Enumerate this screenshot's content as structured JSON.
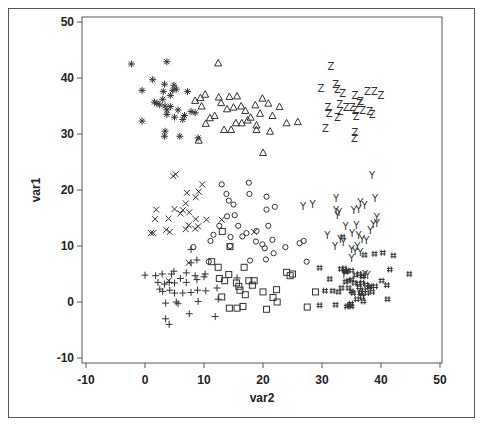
{
  "chart_data": {
    "type": "scatter",
    "title": "",
    "xlabel": "var2",
    "ylabel": "var1",
    "xlim": [
      -10,
      50
    ],
    "ylim": [
      -10,
      50
    ],
    "xticks": [
      -10,
      0,
      10,
      20,
      30,
      40,
      50
    ],
    "yticks": [
      -10,
      0,
      10,
      20,
      30,
      40,
      50
    ],
    "grid": false,
    "legend": null,
    "series": [
      {
        "name": "group_star",
        "marker": "*",
        "points": [
          [
            -2.3,
            42.5
          ],
          [
            3.7,
            42.9
          ],
          [
            -0.5,
            37.8
          ],
          [
            1.3,
            39.7
          ],
          [
            3.3,
            38.9
          ],
          [
            2.0,
            35.5
          ],
          [
            1.6,
            35.7
          ],
          [
            3.0,
            36.2
          ],
          [
            3.1,
            37.6
          ],
          [
            4.7,
            37.8
          ],
          [
            4.9,
            38.7
          ],
          [
            5.3,
            38.0
          ],
          [
            4.3,
            36.9
          ],
          [
            3.4,
            35.0
          ],
          [
            4.3,
            34.9
          ],
          [
            5.6,
            34.3
          ],
          [
            3.7,
            34.3
          ],
          [
            2.5,
            35.2
          ],
          [
            3.7,
            33.5
          ],
          [
            5.0,
            33.0
          ],
          [
            6.7,
            33.3
          ],
          [
            6.4,
            32.6
          ],
          [
            7.8,
            34.0
          ],
          [
            7.2,
            37.6
          ],
          [
            -0.5,
            32.3
          ],
          [
            3.4,
            30.5
          ],
          [
            3.3,
            29.6
          ],
          [
            5.9,
            29.6
          ],
          [
            9.0,
            29.3
          ],
          [
            8.5,
            33.8
          ]
        ]
      },
      {
        "name": "group_triangle",
        "marker": "△",
        "points": [
          [
            12.4,
            42.7
          ],
          [
            8.5,
            36.0
          ],
          [
            9.4,
            36.5
          ],
          [
            10.2,
            37.1
          ],
          [
            9.6,
            35.0
          ],
          [
            11.0,
            32.9
          ],
          [
            10.3,
            31.9
          ],
          [
            11.8,
            33.3
          ],
          [
            12.5,
            36.6
          ],
          [
            12.9,
            35.6
          ],
          [
            13.9,
            34.5
          ],
          [
            14.3,
            36.7
          ],
          [
            15.6,
            36.8
          ],
          [
            15.0,
            34.8
          ],
          [
            16.3,
            35.0
          ],
          [
            17.0,
            34.2
          ],
          [
            15.4,
            32.0
          ],
          [
            16.4,
            32.0
          ],
          [
            17.4,
            32.5
          ],
          [
            17.9,
            33.0
          ],
          [
            18.9,
            31.6
          ],
          [
            19.5,
            33.7
          ],
          [
            18.7,
            35.2
          ],
          [
            19.9,
            36.4
          ],
          [
            20.9,
            35.5
          ],
          [
            21.6,
            33.3
          ],
          [
            22.8,
            34.9
          ],
          [
            24.0,
            32.0
          ],
          [
            25.9,
            32.2
          ],
          [
            14.6,
            30.8
          ],
          [
            13.4,
            30.8
          ],
          [
            18.9,
            30.8
          ],
          [
            9.1,
            28.9
          ],
          [
            21.2,
            30.5
          ],
          [
            20.0,
            26.7
          ]
        ]
      },
      {
        "name": "group_z",
        "marker": "Z",
        "points": [
          [
            31.5,
            42.0
          ],
          [
            29.8,
            38.2
          ],
          [
            32.3,
            38.8
          ],
          [
            32.6,
            38.0
          ],
          [
            33.5,
            37.3
          ],
          [
            35.6,
            36.8
          ],
          [
            36.5,
            35.8
          ],
          [
            37.7,
            37.6
          ],
          [
            38.9,
            37.6
          ],
          [
            40.0,
            36.8
          ],
          [
            33.0,
            35.2
          ],
          [
            34.1,
            34.8
          ],
          [
            35.1,
            34.7
          ],
          [
            35.6,
            34.2
          ],
          [
            36.4,
            35.5
          ],
          [
            36.9,
            34.2
          ],
          [
            31.0,
            34.7
          ],
          [
            31.2,
            33.6
          ],
          [
            32.6,
            33.0
          ],
          [
            33.1,
            34.0
          ],
          [
            35.8,
            33.2
          ],
          [
            38.1,
            34.1
          ],
          [
            38.5,
            33.5
          ],
          [
            30.6,
            31.0
          ],
          [
            35.6,
            30.2
          ],
          [
            35.5,
            29.2
          ]
        ]
      },
      {
        "name": "group_x",
        "marker": "×",
        "points": [
          [
            4.8,
            22.5
          ],
          [
            5.2,
            22.8
          ],
          [
            9.7,
            21.0
          ],
          [
            9.1,
            19.7
          ],
          [
            7.1,
            19.5
          ],
          [
            8.6,
            18.7
          ],
          [
            6.9,
            17.6
          ],
          [
            1.9,
            16.5
          ],
          [
            5.0,
            16.6
          ],
          [
            6.0,
            15.8
          ],
          [
            6.4,
            16.4
          ],
          [
            7.5,
            16.0
          ],
          [
            8.6,
            14.8
          ],
          [
            10.4,
            14.7
          ],
          [
            9.0,
            13.5
          ],
          [
            1.7,
            14.8
          ],
          [
            4.0,
            14.9
          ],
          [
            7.4,
            13.7
          ],
          [
            6.9,
            13.0
          ],
          [
            8.5,
            13.1
          ],
          [
            1.4,
            12.3
          ],
          [
            1.0,
            12.3
          ],
          [
            3.6,
            12.9
          ],
          [
            4.2,
            12.5
          ],
          [
            13.0,
            14.7
          ],
          [
            18.5,
            12.5
          ],
          [
            7.4,
            7.0
          ],
          [
            4.0,
            3.8
          ]
        ]
      },
      {
        "name": "group_diamond",
        "marker": "◇",
        "points": [
          [
            13.0,
            21.0
          ],
          [
            17.6,
            21.3
          ],
          [
            13.8,
            19.3
          ],
          [
            14.2,
            18.1
          ],
          [
            17.7,
            19.3
          ],
          [
            20.6,
            18.8
          ],
          [
            15.0,
            17.4
          ],
          [
            22.0,
            17.0
          ],
          [
            13.9,
            15.3
          ],
          [
            15.2,
            15.5
          ],
          [
            20.6,
            16.5
          ],
          [
            12.6,
            13.6
          ],
          [
            15.8,
            13.6
          ],
          [
            17.2,
            12.3
          ],
          [
            18.9,
            12.7
          ],
          [
            16.5,
            11.7
          ],
          [
            20.9,
            13.6
          ],
          [
            11.6,
            12.0
          ],
          [
            21.6,
            11.1
          ],
          [
            14.5,
            11.6
          ],
          [
            18.8,
            10.8
          ],
          [
            26.2,
            10.5
          ],
          [
            26.9,
            10.9
          ],
          [
            11.1,
            10.9
          ],
          [
            14.4,
            10.0
          ],
          [
            19.9,
            10.3
          ],
          [
            20.3,
            9.6
          ],
          [
            23.8,
            9.8
          ],
          [
            21.8,
            8.7
          ],
          [
            17.8,
            7.4
          ],
          [
            20.5,
            7.6
          ],
          [
            8.2,
            9.8
          ],
          [
            10.8,
            7.2
          ],
          [
            27.4,
            7.2
          ]
        ]
      },
      {
        "name": "group_square",
        "marker": "□",
        "points": [
          [
            13.1,
            12.6
          ],
          [
            14.4,
            9.9
          ],
          [
            11.3,
            7.2
          ],
          [
            12.4,
            6.2
          ],
          [
            14.2,
            4.9
          ],
          [
            16.8,
            6.2
          ],
          [
            12.6,
            4.2
          ],
          [
            13.5,
            3.8
          ],
          [
            15.5,
            3.4
          ],
          [
            18.2,
            3.0
          ],
          [
            18.5,
            3.8
          ],
          [
            17.6,
            3.8
          ],
          [
            15.9,
            2.8
          ],
          [
            16.1,
            2.1
          ],
          [
            24.0,
            5.3
          ],
          [
            25.0,
            5.0
          ],
          [
            24.6,
            4.7
          ],
          [
            22.3,
            2.2
          ],
          [
            17.0,
            1.3
          ],
          [
            20.0,
            1.8
          ],
          [
            21.7,
            0.8
          ],
          [
            28.9,
            1.8
          ],
          [
            13.0,
            0.9
          ],
          [
            16.6,
            -0.8
          ],
          [
            15.6,
            -1.1
          ],
          [
            14.3,
            -1.1
          ],
          [
            27.5,
            -0.9
          ],
          [
            20.6,
            -1.3
          ],
          [
            22.4,
            0.0
          ]
        ]
      },
      {
        "name": "group_plus",
        "marker": "+",
        "points": [
          [
            7.8,
            9.4
          ],
          [
            8.8,
            7.5
          ],
          [
            7.8,
            7.0
          ],
          [
            4.9,
            5.5
          ],
          [
            7.0,
            5.2
          ],
          [
            10.2,
            5.0
          ],
          [
            8.5,
            4.7
          ],
          [
            0.0,
            4.8
          ],
          [
            1.8,
            4.7
          ],
          [
            2.9,
            5.0
          ],
          [
            4.5,
            5.0
          ],
          [
            6.0,
            4.2
          ],
          [
            2.2,
            3.5
          ],
          [
            3.3,
            3.2
          ],
          [
            4.1,
            3.5
          ],
          [
            5.0,
            3.4
          ],
          [
            7.0,
            3.5
          ],
          [
            8.8,
            4.0
          ],
          [
            10.0,
            4.5
          ],
          [
            2.5,
            2.3
          ],
          [
            3.0,
            1.9
          ],
          [
            4.2,
            2.1
          ],
          [
            5.0,
            1.6
          ],
          [
            6.4,
            1.6
          ],
          [
            7.8,
            1.7
          ],
          [
            8.9,
            2.1
          ],
          [
            10.3,
            2.0
          ],
          [
            12.2,
            2.5
          ],
          [
            12.4,
            0.5
          ],
          [
            3.5,
            -0.2
          ],
          [
            5.6,
            -0.3
          ],
          [
            5.3,
            0.0
          ],
          [
            9.0,
            0.1
          ],
          [
            7.5,
            -2.1
          ],
          [
            3.5,
            -3.0
          ],
          [
            15.6,
            4.3
          ],
          [
            11.9,
            -2.6
          ],
          [
            4.1,
            -4.0
          ]
        ]
      },
      {
        "name": "group_y",
        "marker": "Y",
        "points": [
          [
            38.5,
            22.6
          ],
          [
            32.4,
            18.4
          ],
          [
            39.0,
            18.4
          ],
          [
            28.4,
            17.5
          ],
          [
            26.8,
            17.0
          ],
          [
            32.4,
            16.4
          ],
          [
            32.9,
            15.9
          ],
          [
            36.5,
            17.8
          ],
          [
            37.2,
            17.2
          ],
          [
            36.2,
            16.5
          ],
          [
            35.4,
            16.3
          ],
          [
            32.6,
            15.4
          ],
          [
            39.3,
            15.1
          ],
          [
            39.3,
            14.1
          ],
          [
            35.8,
            13.6
          ],
          [
            34.0,
            13.4
          ],
          [
            38.7,
            13.9
          ],
          [
            38.2,
            12.7
          ],
          [
            35.1,
            12.3
          ],
          [
            36.2,
            11.8
          ],
          [
            36.8,
            11.2
          ],
          [
            37.5,
            11.0
          ],
          [
            30.9,
            11.8
          ],
          [
            33.1,
            11.2
          ],
          [
            33.6,
            10.7
          ],
          [
            36.0,
            10.0
          ],
          [
            32.2,
            10.0
          ],
          [
            35.0,
            9.4
          ],
          [
            35.6,
            9.1
          ],
          [
            36.5,
            8.8
          ],
          [
            35.0,
            7.8
          ],
          [
            37.3,
            5.0
          ],
          [
            37.7,
            4.8
          ],
          [
            33.7,
            5.0
          ]
        ]
      },
      {
        "name": "group_hash",
        "marker": "♯",
        "points": [
          [
            33.5,
            11.6
          ],
          [
            37.2,
            8.4
          ],
          [
            38.9,
            8.6
          ],
          [
            40.3,
            8.8
          ],
          [
            42.1,
            8.3
          ],
          [
            41.5,
            5.8
          ],
          [
            44.8,
            5.0
          ],
          [
            29.6,
            6.1
          ],
          [
            33.2,
            5.9
          ],
          [
            33.8,
            6.0
          ],
          [
            33.9,
            5.5
          ],
          [
            34.1,
            5.4
          ],
          [
            34.3,
            5.6
          ],
          [
            35.0,
            5.6
          ],
          [
            35.7,
            4.8
          ],
          [
            36.3,
            5.0
          ],
          [
            36.8,
            4.6
          ],
          [
            37.0,
            4.6
          ],
          [
            31.3,
            4.1
          ],
          [
            34.0,
            3.6
          ],
          [
            34.5,
            3.8
          ],
          [
            35.0,
            4.0
          ],
          [
            35.5,
            3.4
          ],
          [
            36.8,
            3.4
          ],
          [
            37.5,
            3.1
          ],
          [
            38.2,
            2.8
          ],
          [
            39.0,
            2.8
          ],
          [
            40.1,
            3.8
          ],
          [
            41.0,
            3.0
          ],
          [
            36.2,
            3.3
          ],
          [
            33.3,
            2.5
          ],
          [
            35.0,
            1.9
          ],
          [
            35.3,
            1.6
          ],
          [
            36.6,
            1.7
          ],
          [
            36.3,
            2.6
          ],
          [
            34.5,
            2.5
          ],
          [
            30.5,
            2.0
          ],
          [
            31.8,
            2.0
          ],
          [
            32.8,
            1.8
          ],
          [
            36.5,
            1.6
          ],
          [
            35.9,
            0.5
          ],
          [
            36.8,
            0.9
          ],
          [
            37.6,
            1.6
          ],
          [
            37.1,
            2.1
          ],
          [
            38.0,
            2.6
          ],
          [
            38.5,
            1.8
          ],
          [
            37.0,
            0.1
          ],
          [
            41.1,
            0.5
          ],
          [
            29.6,
            -0.6
          ],
          [
            32.3,
            -0.5
          ],
          [
            34.2,
            -0.8
          ],
          [
            34.6,
            -0.6
          ],
          [
            34.9,
            -0.3
          ],
          [
            35.0,
            -0.8
          ]
        ]
      }
    ]
  }
}
